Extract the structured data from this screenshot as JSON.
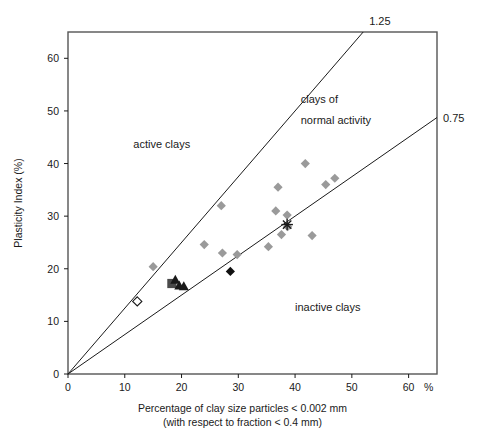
{
  "chart_data": {
    "type": "scatter",
    "title": "",
    "xlabel": "Percentage of clay size particles < 0.002 mm",
    "xlabel_sub": "(with respect to fraction < 0.4 mm)",
    "ylabel": "Plasticity Index (%)",
    "xlim": [
      0,
      65
    ],
    "ylim": [
      0,
      65
    ],
    "xticks": [
      0,
      10,
      20,
      30,
      40,
      50,
      60
    ],
    "yticks": [
      0,
      10,
      20,
      30,
      40,
      50,
      60
    ],
    "xtick_labels": [
      "0",
      "10",
      "20",
      "30",
      "40",
      "50",
      "60"
    ],
    "ytick_labels": [
      "0",
      "10",
      "20",
      "30",
      "40",
      "50",
      "60"
    ],
    "x_unit_symbol": "%",
    "grid": false,
    "legend": "none",
    "activity_lines": [
      {
        "name": "1.25",
        "label": "1.25",
        "slope": 1.25,
        "intercept": 0,
        "color": "#1a1a1a"
      },
      {
        "name": "0.75",
        "label": "0.75",
        "slope": 0.75,
        "intercept": 0,
        "color": "#1a1a1a"
      }
    ],
    "region_labels": [
      {
        "name": "active-clays",
        "text": "active clays",
        "x": 11.5,
        "y": 43.0
      },
      {
        "name": "clays-of-normal-activity-line1",
        "text": "clays of",
        "x": 41.0,
        "y": 51.5
      },
      {
        "name": "clays-of-normal-activity-line2",
        "text": "normal activity",
        "x": 41.0,
        "y": 47.5
      },
      {
        "name": "inactive-clays",
        "text": "inactive clays",
        "x": 40.0,
        "y": 12.0
      }
    ],
    "series": [
      {
        "name": "grey-diamonds",
        "marker": "diamond",
        "color": "#9a9a9a",
        "filled": true,
        "points": [
          [
            15.0,
            20.4
          ],
          [
            24.0,
            24.6
          ],
          [
            27.0,
            32.0
          ],
          [
            27.2,
            23.0
          ],
          [
            29.8,
            22.7
          ],
          [
            35.3,
            24.2
          ],
          [
            36.6,
            31.0
          ],
          [
            37.0,
            35.5
          ],
          [
            37.6,
            26.5
          ],
          [
            38.6,
            30.2
          ],
          [
            38.7,
            28.0
          ],
          [
            41.8,
            40.0
          ],
          [
            43.0,
            26.3
          ],
          [
            45.4,
            36.0
          ],
          [
            47.0,
            37.2
          ]
        ]
      },
      {
        "name": "black-diamond",
        "marker": "diamond",
        "color": "#111111",
        "filled": true,
        "points": [
          [
            28.6,
            19.5
          ]
        ]
      },
      {
        "name": "open-diamond",
        "marker": "diamond",
        "color": "#ffffff",
        "edge": "#1a1a1a",
        "filled": false,
        "points": [
          [
            12.2,
            13.8
          ]
        ]
      },
      {
        "name": "dark-square",
        "marker": "square",
        "color": "#4a4a4a",
        "filled": true,
        "points": [
          [
            18.3,
            17.2
          ]
        ]
      },
      {
        "name": "dark-triangles",
        "marker": "triangle",
        "color": "#1a1a1a",
        "filled": true,
        "points": [
          [
            18.9,
            17.9
          ],
          [
            19.6,
            16.8
          ],
          [
            20.4,
            16.7
          ]
        ]
      },
      {
        "name": "cross-marker",
        "marker": "asterisk",
        "color": "#1a1a1a",
        "filled": false,
        "points": [
          [
            38.6,
            28.4
          ]
        ]
      }
    ]
  },
  "axes": {
    "x_axis_name": "x-axis",
    "y_axis_name": "y-axis",
    "border_color": "#555555"
  }
}
